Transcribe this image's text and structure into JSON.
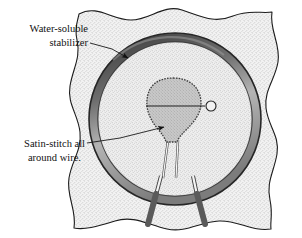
{
  "figure": {
    "background_color": "#ffffff"
  },
  "annotations": [
    {
      "id": "water-soluble-stabilizer",
      "line1": "Water-soluble",
      "line2": "stabilizer",
      "text_x": 88,
      "text_y": 32,
      "text_anchor": "end",
      "line_from_x": 90,
      "line_from_y": 45,
      "line_to_x": 125,
      "line_to_y": 57,
      "arrow": true
    },
    {
      "id": "satin-stitch-all-around-wire",
      "line1": "Satin-stitch all",
      "line2": "around wire.",
      "text_x": 85,
      "text_y": 147,
      "text_anchor": "end",
      "line_from_x": 10,
      "line_from_y": 150,
      "line_to_x": 167,
      "line_to_y": 126,
      "arrow": true
    }
  ],
  "fabric": {
    "name": "water-soluble-stabilizer-sheet",
    "fill_color": "#f0f0f0",
    "stroke_color": "#1c1c1c",
    "stipple_color": "#8d8d8d"
  },
  "hoop": {
    "name": "embroidery-hoop-ring",
    "center_x": 175,
    "center_y": 119,
    "outer_radius": 86,
    "ring_thickness": 9,
    "outer_stroke_color": "#2b2b2b",
    "band_color": "#8f8f8f",
    "highlight_color": "#d8d8d8",
    "inner_fill_color": "#eeeeee"
  },
  "wire_shape": {
    "name": "wire-teardrop-shape",
    "fill_color": "#c2c2c2",
    "outline_color": "#3a3a3a",
    "center_x": 173,
    "center_y": 108,
    "bead_circle_x": 210,
    "bead_circle_y": 106,
    "bead_circle_r": 5,
    "axis_line_y": 106
  },
  "wire_legs": {
    "name": "wire-legs",
    "upper_color": "#f4f4f4",
    "upper_stroke": "#4a4a4a",
    "lower_color": "#5a5a5a",
    "count": 2
  },
  "colors": {
    "ink": "#111111",
    "leader_line": "#1a1a1a"
  }
}
